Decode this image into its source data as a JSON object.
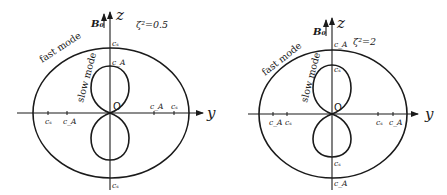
{
  "diagrams": [
    {
      "id": "left",
      "parameter": "ζ² = 0.5",
      "parameter_text": "ζ²=0.5",
      "field_label": "B₀",
      "z_axis_label": "z",
      "y_axis_label": "y",
      "origin_label": "O",
      "fast_mode_label": "fast mode",
      "slow_mode_label": "slow mode",
      "z_top_fast": "cₛ",
      "z_top_slow": "c_A",
      "z_bottom_fast": "cₛ",
      "y_left_outer": "cₛ",
      "y_left_inner": "c_A",
      "y_right_inner": "c_A",
      "y_right_outer": "cₛ"
    },
    {
      "id": "right",
      "parameter": "ζ² = 2",
      "parameter_text": "ζ²=2",
      "field_label": "B₀",
      "z_axis_label": "z",
      "y_axis_label": "y",
      "origin_label": "O",
      "fast_mode_label": "fast mode",
      "slow_mode_label": "slow mode",
      "z_top_fast": "c_A",
      "z_top_slow": "cₛ",
      "z_bottom_slow": "cₛ",
      "z_bottom_fast": "c_A",
      "y_left_outer": "c_A",
      "y_left_inner": "cₛ",
      "y_right_inner": "cₛ",
      "y_right_outer": "c_A"
    }
  ],
  "labels": {
    "cs": "c",
    "cs_sub": "s",
    "ca": "c",
    "ca_sub": "A"
  }
}
